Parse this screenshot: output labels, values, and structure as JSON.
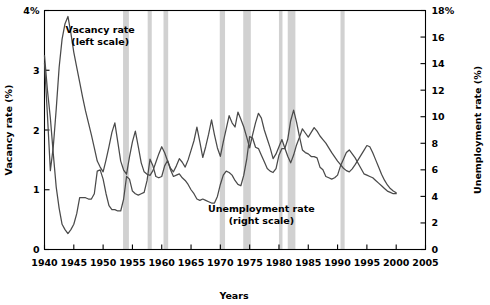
{
  "chart_data": {
    "type": "line",
    "title": "",
    "xlabel": "Years",
    "ylabel": "Vacancy rate (%)",
    "y2label": "Unemployment rate (%)",
    "xlim": [
      1940,
      2005
    ],
    "ylim": [
      0,
      4
    ],
    "y2lim": [
      0,
      18
    ],
    "grid": false,
    "legend_position": "inline-annotation",
    "x_ticks": [
      1940,
      1945,
      1950,
      1955,
      1960,
      1965,
      1970,
      1975,
      1980,
      1985,
      1990,
      1995,
      2000,
      2005
    ],
    "x_tick_labels": [
      "1940",
      "1945",
      "1950",
      "1955",
      "1960",
      "1965",
      "1970",
      "1975",
      "1980",
      "1985",
      "1990",
      "1995",
      "2000",
      "2005"
    ],
    "y_ticks": [
      0,
      1,
      2,
      3,
      4
    ],
    "y_tick_labels": [
      "0",
      "1",
      "2",
      "3",
      "4%"
    ],
    "y2_ticks": [
      0,
      2,
      4,
      6,
      8,
      10,
      12,
      14,
      16,
      18
    ],
    "y2_tick_labels": [
      "0",
      "2",
      "4",
      "6",
      "8",
      "10",
      "12",
      "14",
      "16",
      "18%"
    ],
    "annotations": [
      {
        "name": "vacancy-label",
        "text": "Vacancy rate",
        "subtext": "(left scale)",
        "x": 1949.5,
        "y": 3.62
      },
      {
        "name": "unemployment-label",
        "text": "Unemployment rate",
        "subtext": "(right scale)",
        "x": 1977.0,
        "y": 0.62
      }
    ],
    "recession_bands": [
      {
        "start": 1953.4,
        "end": 1954.4
      },
      {
        "start": 1957.6,
        "end": 1958.3
      },
      {
        "start": 1960.3,
        "end": 1961.1
      },
      {
        "start": 1969.9,
        "end": 1970.8
      },
      {
        "start": 1973.9,
        "end": 1975.2
      },
      {
        "start": 1980.0,
        "end": 1980.6
      },
      {
        "start": 1981.5,
        "end": 1982.8
      },
      {
        "start": 1990.5,
        "end": 1991.2
      }
    ],
    "series": [
      {
        "name": "Vacancy rate",
        "scale": "left",
        "axis_label": "Vacancy rate (%)",
        "color": "#4a4a4a",
        "x": [
          1940,
          1940.5,
          1941,
          1941.5,
          1942,
          1942.5,
          1943,
          1943.5,
          1944,
          1944.5,
          1945,
          1945.5,
          1946,
          1946.5,
          1947,
          1947.5,
          1948,
          1948.5,
          1949,
          1949.5,
          1950,
          1950.5,
          1951,
          1951.5,
          1952,
          1952.5,
          1953,
          1953.5,
          1954,
          1954.5,
          1955,
          1955.5,
          1956,
          1956.5,
          1957,
          1957.5,
          1958,
          1958.5,
          1959,
          1959.5,
          1960,
          1960.5,
          1961,
          1961.5,
          1962,
          1962.5,
          1963,
          1963.5,
          1964,
          1964.5,
          1965,
          1965.5,
          1966,
          1966.5,
          1967,
          1967.5,
          1968,
          1968.5,
          1969,
          1969.5,
          1970,
          1970.5,
          1971,
          1971.5,
          1972,
          1972.5,
          1973,
          1973.5,
          1974,
          1974.5,
          1975,
          1975.5,
          1976,
          1976.5,
          1977,
          1977.5,
          1978,
          1978.5,
          1979,
          1979.5,
          1980,
          1980.5,
          1981,
          1981.5,
          1982,
          1982.5,
          1983,
          1983.5,
          1984,
          1984.5,
          1985,
          1985.5,
          1986,
          1986.5,
          1987,
          1987.5,
          1988,
          1988.5,
          1989,
          1989.5,
          1990,
          1990.5,
          1991,
          1991.5,
          1992,
          1992.5,
          1993,
          1993.5,
          1994,
          1994.5,
          1995,
          1995.5,
          1996,
          1996.5,
          1997,
          1997.5,
          1998,
          1998.5,
          1999,
          1999.5,
          2000
        ],
        "y": [
          3.12,
          2.25,
          1.32,
          1.72,
          2.35,
          3.05,
          3.52,
          3.78,
          3.9,
          3.62,
          3.3,
          3.05,
          2.8,
          2.55,
          2.32,
          2.12,
          1.92,
          1.7,
          1.48,
          1.38,
          1.3,
          1.5,
          1.72,
          1.96,
          2.12,
          1.8,
          1.48,
          1.33,
          1.26,
          1.55,
          1.8,
          1.98,
          1.72,
          1.45,
          1.3,
          1.26,
          1.24,
          1.32,
          1.46,
          1.6,
          1.72,
          1.62,
          1.48,
          1.36,
          1.3,
          1.4,
          1.52,
          1.46,
          1.38,
          1.5,
          1.66,
          1.82,
          2.05,
          1.8,
          1.54,
          1.72,
          1.93,
          2.17,
          1.92,
          1.7,
          1.56,
          1.8,
          2.02,
          2.24,
          2.12,
          2.05,
          2.3,
          2.18,
          2.05,
          1.88,
          1.7,
          1.92,
          2.12,
          2.28,
          2.2,
          2.0,
          1.85,
          1.7,
          1.52,
          1.6,
          1.72,
          1.84,
          1.7,
          1.56,
          1.45,
          1.58,
          1.75,
          1.88,
          2.02,
          1.95,
          1.88,
          1.96,
          2.04,
          1.98,
          1.9,
          1.84,
          1.78,
          1.7,
          1.62,
          1.55,
          1.48,
          1.42,
          1.36,
          1.32,
          1.3,
          1.35,
          1.42,
          1.5,
          1.58,
          1.66,
          1.74,
          1.72,
          1.62,
          1.5,
          1.38,
          1.26,
          1.16,
          1.08,
          1.02,
          0.98,
          0.95
        ]
      },
      {
        "name": "Unemployment rate",
        "scale": "right",
        "axis_label": "Unemployment rate (%)",
        "color": "#4a4a4a",
        "x": [
          1940,
          1940.5,
          1941,
          1941.5,
          1942,
          1942.5,
          1943,
          1943.5,
          1944,
          1944.5,
          1945,
          1945.5,
          1946,
          1946.5,
          1947,
          1947.5,
          1948,
          1948.5,
          1949,
          1949.5,
          1950,
          1950.5,
          1951,
          1951.5,
          1952,
          1952.5,
          1953,
          1953.5,
          1954,
          1954.5,
          1955,
          1955.5,
          1956,
          1956.5,
          1957,
          1957.5,
          1958,
          1958.5,
          1959,
          1959.5,
          1960,
          1960.5,
          1961,
          1961.5,
          1962,
          1962.5,
          1963,
          1963.5,
          1964,
          1964.5,
          1965,
          1965.5,
          1966,
          1966.5,
          1967,
          1967.5,
          1968,
          1968.5,
          1969,
          1969.5,
          1970,
          1970.5,
          1971,
          1971.5,
          1972,
          1972.5,
          1973,
          1973.5,
          1974,
          1974.5,
          1975,
          1975.5,
          1976,
          1976.5,
          1977,
          1977.5,
          1978,
          1978.5,
          1979,
          1979.5,
          1980,
          1980.5,
          1981,
          1981.5,
          1982,
          1982.5,
          1983,
          1983.5,
          1984,
          1984.5,
          1985,
          1985.5,
          1986,
          1986.5,
          1987,
          1987.5,
          1988,
          1988.5,
          1989,
          1989.5,
          1990,
          1990.5,
          1991,
          1991.5,
          1992,
          1992.5,
          1993,
          1993.5,
          1994,
          1994.5,
          1995,
          1995.5,
          1996,
          1996.5,
          1997,
          1997.5,
          1998,
          1998.5,
          1999,
          1999.5,
          2000
        ],
        "y": [
          14.6,
          12.0,
          9.9,
          7.2,
          4.7,
          3.1,
          1.9,
          1.5,
          1.2,
          1.5,
          1.9,
          2.7,
          3.9,
          3.9,
          3.9,
          3.8,
          3.8,
          4.2,
          5.9,
          6.0,
          5.3,
          4.2,
          3.3,
          3.0,
          3.0,
          2.9,
          2.9,
          3.8,
          5.5,
          5.3,
          4.4,
          4.2,
          4.1,
          4.2,
          4.3,
          5.2,
          6.8,
          6.3,
          5.5,
          5.4,
          5.5,
          6.3,
          6.7,
          6.0,
          5.5,
          5.6,
          5.7,
          5.4,
          5.2,
          4.9,
          4.5,
          4.2,
          3.8,
          3.7,
          3.8,
          3.7,
          3.6,
          3.5,
          3.5,
          4.0,
          4.9,
          5.6,
          5.9,
          5.8,
          5.6,
          5.2,
          4.9,
          4.8,
          5.6,
          6.8,
          8.5,
          8.4,
          7.7,
          7.6,
          7.1,
          6.6,
          6.1,
          5.9,
          5.8,
          6.1,
          7.1,
          7.6,
          7.6,
          8.3,
          9.7,
          10.5,
          9.6,
          8.5,
          7.5,
          7.3,
          7.2,
          7.0,
          7.0,
          6.9,
          6.2,
          6.0,
          5.5,
          5.4,
          5.3,
          5.4,
          5.6,
          6.3,
          6.8,
          7.3,
          7.5,
          7.2,
          6.9,
          6.5,
          6.1,
          5.7,
          5.6,
          5.5,
          5.4,
          5.2,
          5.0,
          4.8,
          4.6,
          4.4,
          4.3,
          4.2,
          4.2
        ]
      }
    ]
  },
  "axes": {
    "left_title": "Vacancy rate (%)",
    "right_title": "Unemployment rate (%)",
    "bottom_title": "Years"
  }
}
